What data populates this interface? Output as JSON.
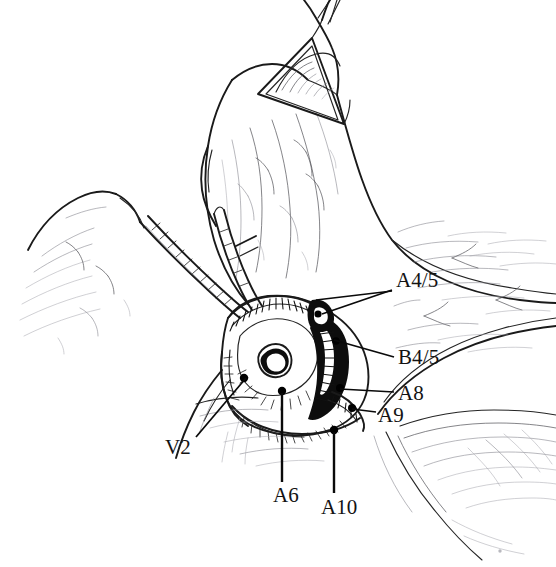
{
  "figure": {
    "kind": "anatomical-line-drawing",
    "style": "pen-and-ink medical illustration",
    "background_color": "#ffffff",
    "ink_color": "#1a1a1a",
    "width": 556,
    "height": 567
  },
  "annotations": [
    {
      "id": "a4-5",
      "label": "A4/5",
      "name": "label-a4-5",
      "structure": "segmental artery A4/5",
      "x": 396,
      "y": 270,
      "leaders": [
        {
          "x1": 392,
          "y1": 290,
          "x2": 322,
          "y2": 314
        },
        {
          "x1": 392,
          "y1": 291,
          "x2": 316,
          "y2": 300
        }
      ]
    },
    {
      "id": "b4-5",
      "label": "B4/5",
      "name": "label-b4-5",
      "structure": "segmental bronchus B4/5",
      "x": 398,
      "y": 347,
      "leaders": [
        {
          "x1": 394,
          "y1": 357,
          "x2": 334,
          "y2": 340
        }
      ]
    },
    {
      "id": "a8",
      "label": "A8",
      "name": "label-a8",
      "structure": "segmental artery A8",
      "x": 398,
      "y": 383,
      "leaders": [
        {
          "x1": 394,
          "y1": 392,
          "x2": 340,
          "y2": 389
        }
      ]
    },
    {
      "id": "a9",
      "label": "A9",
      "name": "label-a9",
      "structure": "segmental artery A9",
      "x": 378,
      "y": 405,
      "leaders": [
        {
          "x1": 376,
          "y1": 412,
          "x2": 352,
          "y2": 409
        }
      ]
    },
    {
      "id": "v2",
      "label": "V2",
      "name": "label-v2",
      "structure": "segmental vein V2",
      "x": 165,
      "y": 437,
      "leaders": [
        {
          "x1": 196,
          "y1": 437,
          "x2": 246,
          "y2": 378
        }
      ]
    },
    {
      "id": "a6",
      "label": "A6",
      "name": "label-a6",
      "structure": "segmental artery A6",
      "x": 273,
      "y": 485,
      "leaders": [
        {
          "x1": 282,
          "y1": 482,
          "x2": 282,
          "y2": 393
        }
      ]
    },
    {
      "id": "a10",
      "label": "A10",
      "name": "label-a10",
      "structure": "segmental artery A10",
      "x": 321,
      "y": 497,
      "leaders": [
        {
          "x1": 334,
          "y1": 493,
          "x2": 334,
          "y2": 432
        }
      ]
    }
  ],
  "structures": [
    {
      "name": "retracted-upper-lobe",
      "description": "Lung lobe retracted superiorly"
    },
    {
      "name": "triangular-retractor",
      "description": "Triangular retractor band at lobe apex"
    },
    {
      "name": "pulmonary-vessel-left",
      "description": "Tubular vessel crossing from left"
    },
    {
      "name": "dissected-hilum",
      "description": "Central dissected hilar field with vessel stumps"
    },
    {
      "name": "lower-lobe-surface",
      "description": "Lower lobe parenchymal surface, right and bottom"
    }
  ]
}
